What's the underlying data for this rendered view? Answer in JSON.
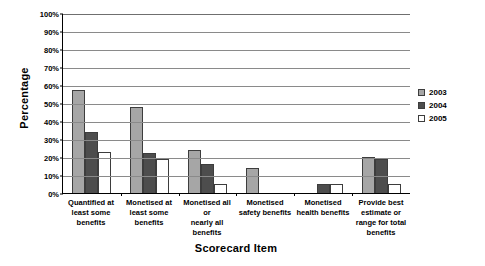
{
  "chart_data": {
    "type": "bar",
    "title": "",
    "xlabel": "Scorecard Item",
    "ylabel": "Percentage",
    "ylim": [
      0,
      100
    ],
    "ytick_step": 10,
    "ytick_labels": [
      "0%",
      "10%",
      "20%",
      "30%",
      "40%",
      "50%",
      "60%",
      "70%",
      "80%",
      "90%",
      "100%"
    ],
    "grid": true,
    "legend_position": "right",
    "categories": [
      "Quantified at least some benefits",
      "Monetised at least some benefits",
      "Monetised all or nearly all benefits",
      "Monetised safety benefits",
      "Monetised health benefits",
      "Provide best estimate or range for total benefits"
    ],
    "category_lines": [
      [
        "Quantified at",
        "least some",
        "benefits"
      ],
      [
        "Monetised at",
        "least some",
        "benefits"
      ],
      [
        "Monetised all or",
        "nearly all",
        "benefits"
      ],
      [
        "Monetised",
        "safety benefits"
      ],
      [
        "Monetised",
        "health benefits"
      ],
      [
        "Provide best",
        "estimate or",
        "range for total",
        "benefits"
      ]
    ],
    "series": [
      {
        "name": "2003",
        "color": "#a6a6a6",
        "values": [
          57,
          48,
          24,
          14,
          0,
          20
        ]
      },
      {
        "name": "2004",
        "color": "#4d4d4d",
        "values": [
          34,
          22,
          16,
          0,
          5,
          19
        ]
      },
      {
        "name": "2005",
        "color": "#ffffff",
        "values": [
          23,
          19,
          5,
          0,
          5,
          5
        ]
      }
    ]
  },
  "legend": {
    "items": [
      {
        "label": "2003"
      },
      {
        "label": "2004"
      },
      {
        "label": "2005"
      }
    ]
  },
  "axis": {
    "y_title": "Percentage",
    "x_title": "Scorecard Item"
  }
}
